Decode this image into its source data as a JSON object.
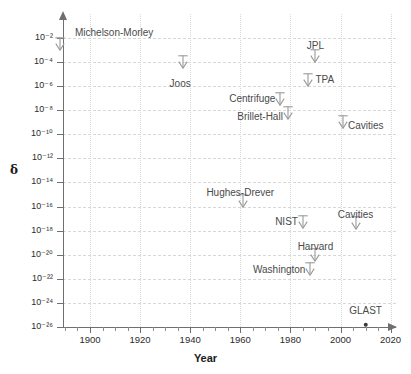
{
  "chart_data": {
    "type": "scatter",
    "title": "",
    "xlabel": "Year",
    "ylabel": "δ",
    "xlim": [
      1888,
      2026
    ],
    "ylim_exponent": [
      -26,
      -2
    ],
    "yscale": "log",
    "grid": true,
    "legend": "none",
    "x_ticks": [
      1900,
      1920,
      1940,
      1960,
      1980,
      2000,
      2020
    ],
    "x_tick_labels": [
      "1900",
      "1920",
      "1940",
      "1960",
      "1980",
      "2000",
      "2020"
    ],
    "x_minor_ticks": [
      1890,
      1910,
      1930,
      1950,
      1970,
      1990,
      2010
    ],
    "y_tick_exponents": [
      -2,
      -4,
      -6,
      -8,
      -10,
      -12,
      -14,
      -16,
      -18,
      -20,
      -22,
      -24,
      -26
    ],
    "y_tick_labels": [
      "10⁻²",
      "10⁻⁴",
      "10⁻⁶",
      "10⁻⁸",
      "10⁻¹⁰",
      "10⁻¹²",
      "10⁻¹⁴",
      "10⁻¹⁶",
      "10⁻¹⁸",
      "10⁻²⁰",
      "10⁻²²",
      "10⁻²⁴",
      "10⁻²⁶"
    ],
    "points": [
      {
        "name": "Michelson-Morley",
        "year": 1888,
        "exponent": -3.0,
        "marker": "upper-limit-arrow",
        "label_x": 1894,
        "label_exponent": -1.6,
        "label_anchor": "start"
      },
      {
        "name": "Joos",
        "year": 1937,
        "exponent": -4.5,
        "marker": "upper-limit-arrow",
        "label_x": 1936,
        "label_exponent": -5.8,
        "label_anchor": "middle"
      },
      {
        "name": "JPL",
        "year": 1990,
        "exponent": -4.0,
        "marker": "upper-limit-arrow",
        "label_x": 1990,
        "label_exponent": -2.7,
        "label_anchor": "middle"
      },
      {
        "name": "TPA",
        "year": 1987,
        "exponent": -6.0,
        "marker": "upper-limit-arrow",
        "label_x": 1990,
        "label_exponent": -5.5,
        "label_anchor": "start"
      },
      {
        "name": "Centrifuge",
        "year": 1976,
        "exponent": -7.6,
        "marker": "upper-limit-arrow",
        "label_x": 1974,
        "label_exponent": -7.1,
        "label_anchor": "end"
      },
      {
        "name": "Brillet-Hall",
        "year": 1979,
        "exponent": -8.7,
        "marker": "upper-limit-arrow",
        "label_x": 1977,
        "label_exponent": -8.6,
        "label_anchor": "end"
      },
      {
        "name": "Cavities",
        "year": 2001,
        "exponent": -9.5,
        "marker": "upper-limit-arrow",
        "label_x": 2003,
        "label_exponent": -9.3,
        "label_anchor": "start"
      },
      {
        "name": "Hughes-Drever",
        "year": 1961,
        "exponent": -16.0,
        "marker": "upper-limit-arrow",
        "label_x": 1960,
        "label_exponent": -14.9,
        "label_anchor": "middle"
      },
      {
        "name": "NIST",
        "year": 1985,
        "exponent": -17.8,
        "marker": "upper-limit-arrow",
        "label_x": 1983,
        "label_exponent": -17.3,
        "label_anchor": "end"
      },
      {
        "name": "Cavities",
        "year": 2006,
        "exponent": -17.9,
        "marker": "upper-limit-arrow",
        "label_x": 2006,
        "label_exponent": -16.7,
        "label_anchor": "middle"
      },
      {
        "name": "Harvard",
        "year": 1990,
        "exponent": -20.5,
        "marker": "upper-limit-arrow",
        "label_x": 1990,
        "label_exponent": -19.4,
        "label_anchor": "middle"
      },
      {
        "name": "Washington",
        "year": 1988,
        "exponent": -21.7,
        "marker": "upper-limit-arrow",
        "label_x": 1986,
        "label_exponent": -21.3,
        "label_anchor": "end"
      },
      {
        "name": "GLAST",
        "year": 2010,
        "exponent": -25.8,
        "marker": "dot",
        "label_x": 2010,
        "label_exponent": -24.7,
        "label_anchor": "middle"
      }
    ]
  },
  "axes": {
    "x_title": "Year",
    "y_title": "δ"
  },
  "colors": {
    "axis": "#6f6f6f",
    "grid": "#d8d8d8",
    "mark": "#9a9a9a",
    "label_text": "#4a4a4a",
    "tick_text": "#2b2b2b",
    "background": "#ffffff",
    "dot": "#3a3a3a"
  }
}
